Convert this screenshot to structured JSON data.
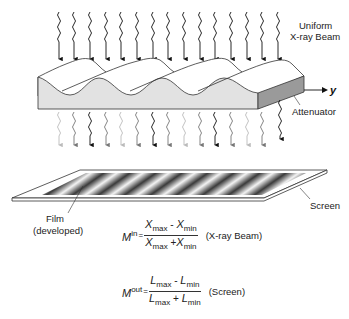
{
  "diagram": {
    "labels": {
      "beam_line1": "Uniform",
      "beam_line2": "X-ray Beam",
      "axis": "y",
      "attenuator": "Attenuator",
      "screen": "Screen",
      "film_line1": "Film",
      "film_line2": "(developed)"
    },
    "incident_arrows": {
      "count": 14,
      "color": "#111111"
    },
    "transmitted_arrows": {
      "count": 14,
      "shades": [
        "#bbbbbb",
        "#777777",
        "#111111",
        "#777777",
        "#bbbbbb",
        "#777777",
        "#111111",
        "#777777",
        "#bbbbbb",
        "#777777",
        "#111111",
        "#777777",
        "#bbbbbb",
        "#777777"
      ],
      "last_arrow_color": "#111111"
    },
    "colors": {
      "attenuator_face": "#e2e2e2",
      "attenuator_side": "#9a9a9a",
      "attenuator_top": "#ffffff",
      "outline": "#333333"
    }
  },
  "equations": {
    "in": {
      "lhs_var": "M",
      "lhs_sup": "in",
      "eq": "=",
      "num_a": "X",
      "num_a_sub": "max",
      "num_op": " - ",
      "num_b": "X",
      "num_b_sub": "min",
      "den_a": "X",
      "den_a_sub": "max",
      "den_op": " +",
      "den_b": "X",
      "den_b_sub": "min",
      "label": "(X-ray Beam)"
    },
    "out": {
      "lhs_var": "M",
      "lhs_sup": "out",
      "eq": "=",
      "num_a": "L",
      "num_a_sub": "max",
      "num_op": " - ",
      "num_b": "L",
      "num_b_sub": "min",
      "den_a": "L",
      "den_a_sub": "max",
      "den_op": " + ",
      "den_b": "L",
      "den_b_sub": "min",
      "label": "(Screen)"
    }
  }
}
